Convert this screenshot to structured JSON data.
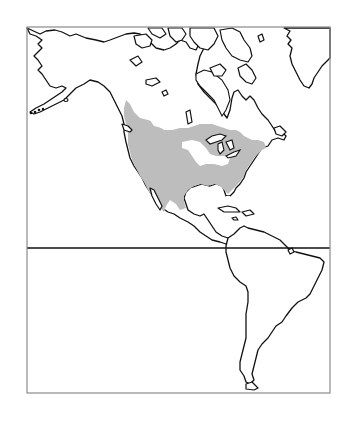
{
  "map": {
    "title": "",
    "region": "Western Hemisphere (North and South America)",
    "projection_frame": {
      "x": 27,
      "y": 27,
      "width": 303,
      "height": 366
    },
    "equator_y": 248,
    "colors": {
      "range_fill": "#bdbdbd",
      "coastline": "#111111",
      "frame": "#8a8a8a",
      "background": "#ffffff"
    },
    "layers": [
      {
        "id": "coastlines",
        "label": "Coastlines",
        "type": "outline"
      },
      {
        "id": "equator",
        "label": "Equator",
        "type": "line"
      },
      {
        "id": "distribution-range",
        "label": "Distribution range",
        "type": "shaded-area",
        "extent": "Western North America from southern Alaska/Yukon through western Canada, the continental United States and northern Mexico, east to the Atlantic coast; excludes the central Great Lakes region and Florida tip"
      }
    ]
  },
  "caption": ""
}
